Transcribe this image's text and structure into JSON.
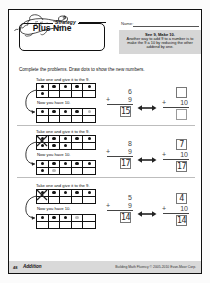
{
  "worksheet": {
    "strategy_tab": "Strategy",
    "strategy_title": "Plus Nine",
    "name_label": "Name:",
    "tip_title": "See 9, Make 10.",
    "tip_body": "Another way to add 9 to a number is to make the 9 a 10 by reducing the other addend by one.",
    "directions": "Complete the problems. Draw dots to show the new numbers.",
    "take_label": "Take one and give it to the 9.",
    "now_label": "Now you have 10."
  },
  "problems": [
    {
      "id": "problem-1",
      "top_dots": 6,
      "bottom_dots": 5,
      "bottom_faint": 1,
      "left_addend": "6",
      "left_nine": "9",
      "left_plus": "+",
      "left_answer": "15",
      "right_addend": "",
      "right_ten": "10",
      "right_plus": "+",
      "right_answer": "",
      "crossed": false
    },
    {
      "id": "problem-2",
      "top_dots": 8,
      "bottom_dots": 7,
      "bottom_faint": 1,
      "left_addend": "8",
      "left_nine": "9",
      "left_plus": "+",
      "left_answer": "17",
      "right_addend": "7",
      "right_ten": "10",
      "right_plus": "+",
      "right_answer": "17",
      "crossed": true
    },
    {
      "id": "problem-3",
      "top_dots": 5,
      "bottom_dots": 4,
      "bottom_faint": 1,
      "left_addend": "5",
      "left_nine": "9",
      "left_plus": "+",
      "left_answer": "14",
      "right_addend": "4",
      "right_ten": "10",
      "right_plus": "+",
      "right_answer": "14",
      "crossed": true
    }
  ],
  "footer": {
    "page_number": "48",
    "section": "Addition",
    "credit": "Building Math Fluency © 2005-2010 Evan-Moor Corp."
  }
}
